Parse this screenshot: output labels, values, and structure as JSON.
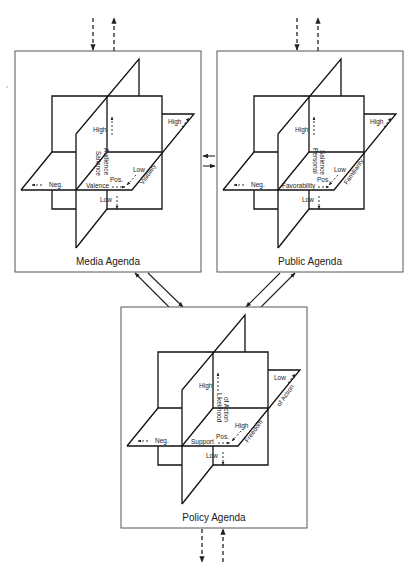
{
  "diagram": {
    "panels": [
      {
        "id": "media",
        "title": "Media Agenda",
        "vertical_axis": {
          "label_line1": "Audience",
          "label_line2": "Salience",
          "high": "High",
          "low": "Low"
        },
        "horizontal_axis": {
          "label": "Valence",
          "neg": "Neg.",
          "pos": "Pos."
        },
        "depth_axis": {
          "label": "Visibility",
          "high": "High",
          "low": "Low"
        }
      },
      {
        "id": "public",
        "title": "Public Agenda",
        "vertical_axis": {
          "label_line1": "Personal",
          "label_line2": "Salience",
          "high": "High",
          "low": "Low"
        },
        "horizontal_axis": {
          "label": "Favorability",
          "neg": "Neg.",
          "pos": "Pos."
        },
        "depth_axis": {
          "label": "Familiarity",
          "high": "High",
          "low": "Low"
        }
      },
      {
        "id": "policy",
        "title": "Policy Agenda",
        "vertical_axis": {
          "label_line1": "Likelihood",
          "label_line2": "of Action",
          "high": "High",
          "low": "Low"
        },
        "horizontal_axis": {
          "label": "Support",
          "neg": "Neg.",
          "pos": "Pos."
        },
        "depth_axis": {
          "label_line1": "Freedom",
          "label_line2": "of Action",
          "high": "High",
          "low": "Low"
        }
      }
    ],
    "connections": [
      {
        "from": "external",
        "to": "media",
        "style": "dashed",
        "direction": "in"
      },
      {
        "from": "media",
        "to": "external",
        "style": "dashed",
        "direction": "out"
      },
      {
        "from": "external",
        "to": "public",
        "style": "dashed",
        "direction": "in"
      },
      {
        "from": "public",
        "to": "external",
        "style": "dashed",
        "direction": "out"
      },
      {
        "from": "public",
        "to": "media",
        "style": "solid"
      },
      {
        "from": "media",
        "to": "public",
        "style": "solid"
      },
      {
        "from": "policy",
        "to": "media",
        "style": "solid"
      },
      {
        "from": "media",
        "to": "policy",
        "style": "solid"
      },
      {
        "from": "public",
        "to": "policy",
        "style": "solid"
      },
      {
        "from": "policy",
        "to": "public",
        "style": "solid"
      },
      {
        "from": "policy",
        "to": "external",
        "style": "dashed",
        "direction": "out"
      },
      {
        "from": "external",
        "to": "policy",
        "style": "dashed",
        "direction": "in"
      }
    ]
  }
}
